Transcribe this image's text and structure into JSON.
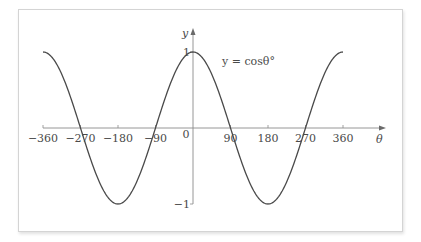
{
  "chart_data": {
    "type": "line",
    "title": "",
    "equation_label": "y = cosθ°",
    "xlabel": "θ",
    "ylabel": "y",
    "x_ticks": [
      -360,
      -270,
      -180,
      -90,
      0,
      90,
      180,
      270,
      360
    ],
    "x_tick_labels": [
      "−360",
      "−270",
      "−180",
      "−90",
      "0",
      "90",
      "180",
      "270",
      "360"
    ],
    "y_ticks": [
      1,
      -1
    ],
    "y_tick_labels": [
      "1",
      "−1"
    ],
    "xlim": [
      -360,
      360
    ],
    "ylim": [
      -1,
      1
    ],
    "grid": false,
    "legend": "none",
    "series": [
      {
        "name": "y = cosθ°",
        "function": "cos(theta degrees)",
        "x": [
          -360,
          -315,
          -270,
          -225,
          -180,
          -135,
          -90,
          -45,
          0,
          45,
          90,
          135,
          180,
          225,
          270,
          315,
          360
        ],
        "values": [
          1,
          0.707,
          0,
          -0.707,
          -1,
          -0.707,
          0,
          0.707,
          1,
          0.707,
          0,
          -0.707,
          -1,
          -0.707,
          0,
          0.707,
          1
        ]
      }
    ],
    "colors": {
      "curve": "#4a4a4a",
      "axis": "#8a8a8a",
      "text": "#4a4a4a",
      "frame": "#d4d4d4"
    }
  }
}
